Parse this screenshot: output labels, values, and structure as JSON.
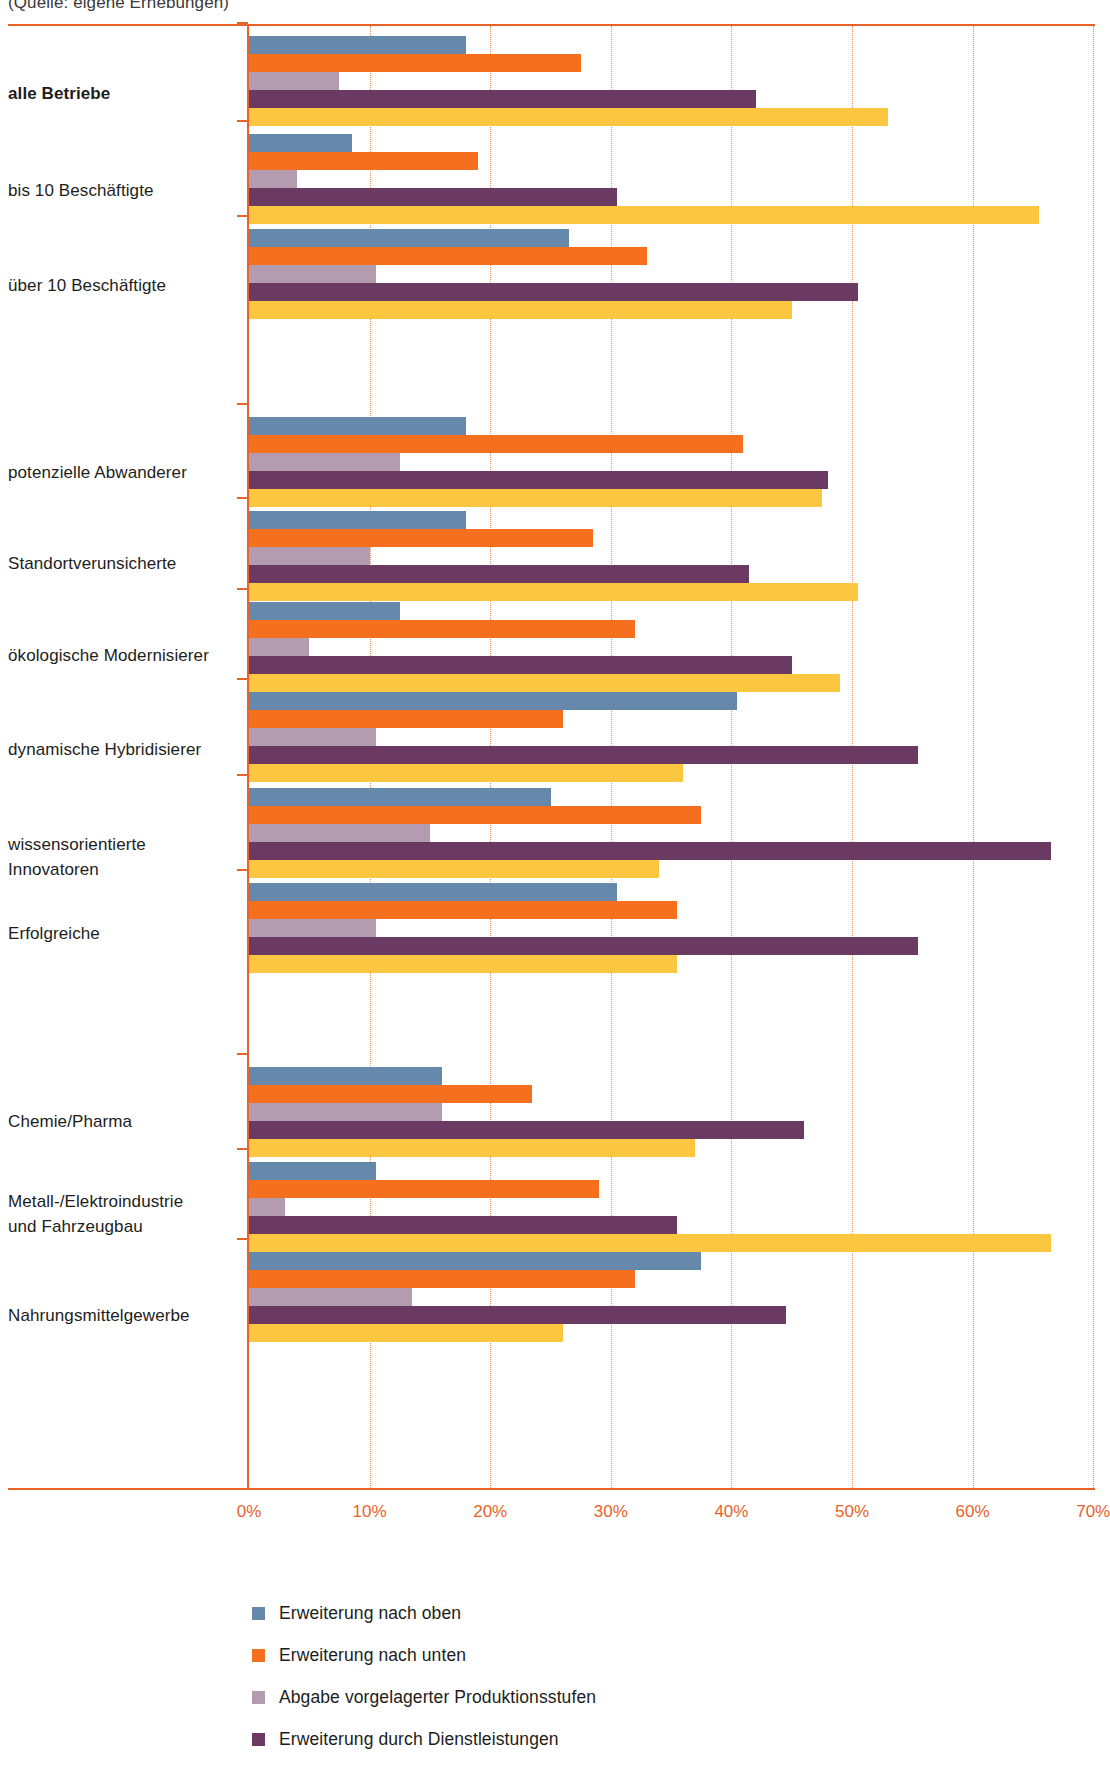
{
  "source_note": "(Quelle: eigene Erhebungen)",
  "axis": {
    "tick_labels": [
      "0%",
      "10%",
      "20%",
      "30%",
      "40%",
      "50%",
      "60%",
      "70%"
    ],
    "tick_values": [
      0,
      10,
      20,
      30,
      40,
      50,
      60,
      70
    ],
    "axis_color": "#e8622a",
    "gridline_color": "#e8905e"
  },
  "legend": {
    "items": [
      {
        "label": "Erweiterung nach oben",
        "color": "#6688aa",
        "swatch_name": "legend-swatch-erweiterung-oben"
      },
      {
        "label": "Erweiterung nach unten",
        "color": "#f4701f",
        "swatch_name": "legend-swatch-erweiterung-unten"
      },
      {
        "label": "Abgabe vorgelagerter Produktionsstufen",
        "color": "#b39cb0",
        "swatch_name": "legend-swatch-abgabe-vorgelagerter"
      },
      {
        "label": "Erweiterung durch Dienstleistungen",
        "color": "#6b3a63",
        "swatch_name": "legend-swatch-erweiterung-dienstleistungen"
      }
    ]
  },
  "chart_data": {
    "type": "bar",
    "orientation": "horizontal",
    "title": "",
    "subtitle": "(Quelle: eigene Erhebungen)",
    "xlabel": "",
    "ylabel": "",
    "xlim": [
      0,
      70
    ],
    "xunit": "%",
    "grid": true,
    "legend_position": "bottom",
    "series": [
      {
        "name": "Erweiterung nach oben",
        "color": "#6688aa",
        "values": [
          18.0,
          8.5,
          26.5,
          18.0,
          18.0,
          12.5,
          40.5,
          25.0,
          30.5,
          16.0,
          10.5,
          37.5
        ]
      },
      {
        "name": "Erweiterung nach unten",
        "color": "#f4701f",
        "values": [
          27.5,
          19.0,
          33.0,
          41.0,
          28.5,
          32.0,
          26.0,
          37.5,
          35.5,
          23.5,
          29.0,
          32.0
        ]
      },
      {
        "name": "Abgabe vorgelagerter Produktionsstufen",
        "color": "#b39cb0",
        "values": [
          7.5,
          4.0,
          10.5,
          12.5,
          10.0,
          5.0,
          10.5,
          15.0,
          10.5,
          16.0,
          3.0,
          13.5
        ]
      },
      {
        "name": "Erweiterung durch Dienstleistungen",
        "color": "#6b3a63",
        "values": [
          42.0,
          30.5,
          50.5,
          48.0,
          41.5,
          45.0,
          55.5,
          66.5,
          55.5,
          46.0,
          35.5,
          44.5
        ]
      },
      {
        "name": "weitere Erweiterung",
        "color": "#fbc741",
        "values": [
          53.0,
          65.5,
          45.0,
          47.5,
          50.5,
          49.0,
          36.0,
          34.0,
          35.5,
          37.0,
          66.5,
          26.0
        ]
      }
    ],
    "categories": [
      {
        "label": "alle Betriebe",
        "bold": true
      },
      {
        "label": "bis 10 Beschäftigte",
        "bold": false
      },
      {
        "label": "über 10 Beschäftigte",
        "bold": false
      },
      {
        "label": "potenzielle Abwanderer",
        "bold": false
      },
      {
        "label": "Standortverunsicherte",
        "bold": false
      },
      {
        "label": "ökologische Modernisierer",
        "bold": false
      },
      {
        "label": "dynamische Hybridisierer",
        "bold": false
      },
      {
        "label": "wissensorientierte Innovatoren",
        "bold": false
      },
      {
        "label": "Erfolgreiche",
        "bold": false
      },
      {
        "label": "Chemie/Pharma",
        "bold": false
      },
      {
        "label": "Metall-/Elektroindustrie\nund Fahrzeugbau",
        "bold": false
      },
      {
        "label": "Nahrungsmittelgewerbe",
        "bold": false
      }
    ],
    "group_tops": [
      12,
      110,
      205,
      393,
      487,
      578,
      668,
      764,
      859,
      1043,
      1138,
      1228
    ],
    "group_label_tops": [
      58,
      155,
      250,
      437,
      528,
      620,
      714,
      809,
      898,
      1086,
      1166,
      1280
    ]
  }
}
